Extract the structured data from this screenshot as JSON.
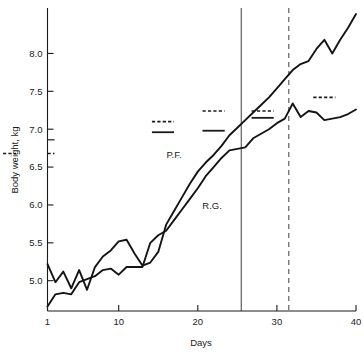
{
  "chart_data": {
    "type": "line",
    "title": "",
    "xlabel": "Days",
    "ylabel": "Body weight, kg",
    "xlim": [
      1,
      40
    ],
    "ylim": [
      4.6,
      8.6
    ],
    "xticks": [
      1,
      10,
      20,
      30,
      40
    ],
    "xtick_labels": [
      "1",
      "10",
      "20",
      "30",
      "40"
    ],
    "yticks": [
      5.0,
      5.5,
      6.0,
      6.5,
      7.0,
      7.5,
      8.0
    ],
    "ytick_labels": [
      "5.0",
      "5.5",
      "6.0",
      "6.5",
      "7.0",
      "7.5",
      "8.0"
    ],
    "grid": false,
    "legend_position": "inline-annotation",
    "series": [
      {
        "name": "P.F.",
        "label": "P.F.",
        "label_x": 17.0,
        "label_y": 6.62,
        "x": [
          1,
          2,
          3,
          4,
          5,
          6,
          7,
          8,
          9,
          10,
          11,
          12,
          13,
          14,
          15,
          16,
          17,
          18,
          19,
          20,
          21,
          22,
          23,
          24,
          25,
          26,
          27,
          28,
          29,
          30,
          31,
          32,
          33,
          34,
          35,
          36,
          37,
          38,
          39,
          40
        ],
        "values": [
          5.22,
          4.98,
          5.12,
          4.9,
          5.14,
          4.88,
          5.18,
          5.32,
          5.4,
          5.52,
          5.54,
          5.36,
          5.2,
          5.24,
          5.38,
          5.74,
          5.92,
          6.1,
          6.28,
          6.44,
          6.56,
          6.66,
          6.78,
          6.92,
          7.02,
          7.12,
          7.22,
          7.32,
          7.42,
          7.54,
          7.66,
          7.78,
          7.86,
          7.9,
          8.06,
          8.18,
          8.0,
          8.18,
          8.34,
          8.52
        ]
      },
      {
        "name": "R.G.",
        "label": "R.G.",
        "label_x": 21.8,
        "label_y": 5.94,
        "x": [
          1,
          2,
          3,
          4,
          5,
          6,
          7,
          8,
          9,
          10,
          11,
          12,
          13,
          14,
          15,
          16,
          17,
          18,
          19,
          20,
          21,
          22,
          23,
          24,
          25,
          26,
          27,
          28,
          29,
          30,
          31,
          32,
          33,
          34,
          35,
          36,
          37,
          38,
          39,
          40
        ],
        "values": [
          4.66,
          4.82,
          4.84,
          4.82,
          4.98,
          5.02,
          5.06,
          5.14,
          5.16,
          5.08,
          5.18,
          5.18,
          5.18,
          5.5,
          5.6,
          5.66,
          5.8,
          5.94,
          6.08,
          6.22,
          6.38,
          6.5,
          6.62,
          6.72,
          6.74,
          6.76,
          6.88,
          6.94,
          7.0,
          7.08,
          7.14,
          7.34,
          7.16,
          7.24,
          7.22,
          7.12,
          7.14,
          7.16,
          7.2,
          7.26
        ]
      }
    ],
    "vertical_lines": [
      {
        "name": "solid-marker-line",
        "style": "solid",
        "x": 25.5
      },
      {
        "name": "dashed-marker-line",
        "style": "dashed",
        "x": 31.5
      }
    ],
    "axis_markers": [
      {
        "name": "baseline-solid-mark",
        "style": "solid",
        "y": 6.86
      },
      {
        "name": "baseline-dashed-mark",
        "style": "dashed",
        "y": 6.68
      }
    ],
    "mean_markers": [
      {
        "group": 1,
        "style": "dashed",
        "x0": 14.2,
        "x1": 17.0,
        "y": 7.1
      },
      {
        "group": 1,
        "style": "solid",
        "x0": 14.2,
        "x1": 17.0,
        "y": 6.96
      },
      {
        "group": 2,
        "style": "dashed",
        "x0": 20.6,
        "x1": 23.4,
        "y": 7.24
      },
      {
        "group": 2,
        "style": "solid",
        "x0": 20.6,
        "x1": 23.4,
        "y": 6.98
      },
      {
        "group": 3,
        "style": "dashed",
        "x0": 26.8,
        "x1": 29.6,
        "y": 7.24
      },
      {
        "group": 3,
        "style": "solid",
        "x0": 26.8,
        "x1": 29.6,
        "y": 7.15
      },
      {
        "group": 4,
        "style": "dashed",
        "x0": 34.6,
        "x1": 37.4,
        "y": 7.42
      }
    ]
  },
  "axes": {
    "ylabel": "Body weight, kg",
    "xlabel": "Days"
  }
}
